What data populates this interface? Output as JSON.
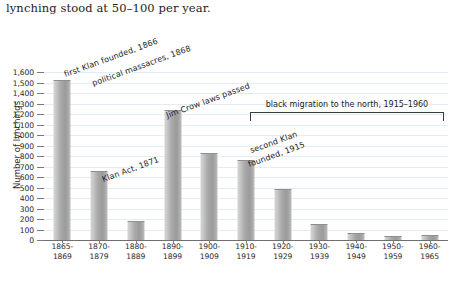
{
  "body_text": "lynching stood at 50–100 per year.",
  "chart_data": {
    "type": "bar",
    "title": "",
    "xlabel": "",
    "ylabel": "Number of lynchings",
    "ylim": [
      0,
      1600
    ],
    "ytick_step": 100,
    "grid": true,
    "legend": "none",
    "bar_color": "#a9a9a9",
    "gridline_color": "#e4eef2",
    "axis_color": "#6f6f6f",
    "categories": [
      "1865–1869",
      "1870–1879",
      "1880–1889",
      "1890–1899",
      "1900–1909",
      "1910–1919",
      "1920–1929",
      "1930–1939",
      "1940–1949",
      "1950–1959",
      "1960–1965"
    ],
    "values": [
      1510,
      650,
      170,
      1225,
      820,
      755,
      480,
      140,
      60,
      25,
      40
    ],
    "ytick_labels": [
      "0",
      "100",
      "200",
      "300",
      "400",
      "500",
      "600",
      "700",
      "800",
      "900",
      "1,000",
      "1,100",
      "1,200",
      "1,300",
      "1,400",
      "1,500",
      "1,600"
    ],
    "annotations": [
      {
        "text": "first Klan founded, 1866",
        "rotation": -20
      },
      {
        "text": "political massacres, 1868",
        "rotation": -20
      },
      {
        "text": "Klan Act, 1871",
        "rotation": -20
      },
      {
        "text": "Jim Crow laws passed",
        "rotation": -20
      },
      {
        "text": "second Klan founded, 1915",
        "rotation": -20
      },
      {
        "text": "black migration to the north, 1915–1960",
        "rotation": 0
      }
    ]
  },
  "x_labels_line1": [
    "1865-",
    "1870-",
    "1880-",
    "1890-",
    "1900-",
    "1910-",
    "1920-",
    "1930-",
    "1940-",
    "1950-",
    "1960-"
  ],
  "x_labels_line2": [
    "1869",
    "1879",
    "1889",
    "1899",
    "1909",
    "1919",
    "1929",
    "1939",
    "1949",
    "1959",
    "1965"
  ],
  "annotation_labels": {
    "first_klan": "first Klan founded, 1866",
    "political_massacres": "political massacres, 1868",
    "klan_act": "Klan Act, 1871",
    "jim_crow": "Jim Crow laws passed",
    "second_klan_line1": "second Klan",
    "second_klan_line2": "founded, 1915",
    "black_migration": "black migration to the north, 1915–1960"
  }
}
